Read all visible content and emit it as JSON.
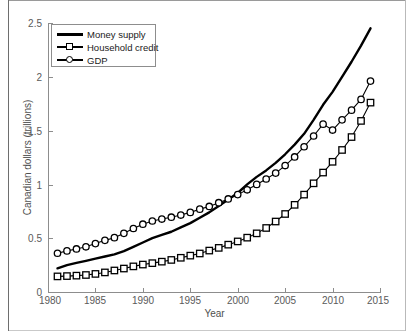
{
  "figure": {
    "background": "#ffffff",
    "axis_color": "#8d8d8d",
    "series_color": "#000000"
  },
  "legend": {
    "position": "top-left",
    "items": [
      {
        "label": "Money supply",
        "marker": "none",
        "style": "thick-line"
      },
      {
        "label": "Household credit",
        "marker": "square",
        "style": "line-marker"
      },
      {
        "label": "GDP",
        "marker": "circle",
        "style": "line-marker"
      }
    ]
  },
  "axes": {
    "xlabel": "Year",
    "ylabel": "Canadian dollars (trillions)",
    "xticks": [
      "1980",
      "1985",
      "1990",
      "1995",
      "2000",
      "2005",
      "2010",
      "2015"
    ],
    "yticks": [
      "0",
      "0.5",
      "1",
      "1.5",
      "2",
      "2.5"
    ]
  },
  "chart_data": {
    "type": "line",
    "title": "",
    "xlabel": "Year",
    "ylabel": "Canadian dollars (trillions)",
    "xlim": [
      1980,
      2015
    ],
    "ylim": [
      0,
      2.5
    ],
    "xticks": [
      1980,
      1985,
      1990,
      1995,
      2000,
      2005,
      2010,
      2015
    ],
    "yticks": [
      0,
      0.5,
      1,
      1.5,
      2,
      2.5
    ],
    "grid": false,
    "legend_position": "upper left",
    "x": [
      1981,
      1982,
      1983,
      1984,
      1985,
      1986,
      1987,
      1988,
      1989,
      1990,
      1991,
      1992,
      1993,
      1994,
      1995,
      1996,
      1997,
      1998,
      1999,
      2000,
      2001,
      2002,
      2003,
      2004,
      2005,
      2006,
      2007,
      2008,
      2009,
      2010,
      2011,
      2012,
      2013,
      2014
    ],
    "series": [
      {
        "name": "Money supply",
        "marker": "none",
        "values": [
          0.22,
          0.25,
          0.27,
          0.29,
          0.31,
          0.33,
          0.35,
          0.38,
          0.42,
          0.46,
          0.5,
          0.53,
          0.56,
          0.6,
          0.64,
          0.69,
          0.74,
          0.8,
          0.86,
          0.92,
          1.0,
          1.07,
          1.13,
          1.2,
          1.28,
          1.37,
          1.47,
          1.6,
          1.74,
          1.86,
          2.0,
          2.14,
          2.29,
          2.45
        ]
      },
      {
        "name": "Household credit",
        "marker": "square",
        "values": [
          0.145,
          0.148,
          0.152,
          0.158,
          0.168,
          0.182,
          0.2,
          0.218,
          0.238,
          0.255,
          0.268,
          0.282,
          0.298,
          0.318,
          0.338,
          0.358,
          0.385,
          0.41,
          0.44,
          0.47,
          0.505,
          0.545,
          0.595,
          0.655,
          0.725,
          0.81,
          0.905,
          1.01,
          1.11,
          1.21,
          1.32,
          1.44,
          1.59,
          1.76
        ]
      },
      {
        "name": "GDP",
        "marker": "circle",
        "values": [
          0.36,
          0.382,
          0.4,
          0.42,
          0.45,
          0.48,
          0.505,
          0.545,
          0.59,
          0.63,
          0.66,
          0.678,
          0.695,
          0.715,
          0.74,
          0.77,
          0.795,
          0.83,
          0.865,
          0.905,
          0.95,
          1.0,
          1.05,
          1.105,
          1.175,
          1.255,
          1.35,
          1.45,
          1.56,
          1.505,
          1.6,
          1.69,
          1.79,
          1.96
        ]
      }
    ]
  }
}
